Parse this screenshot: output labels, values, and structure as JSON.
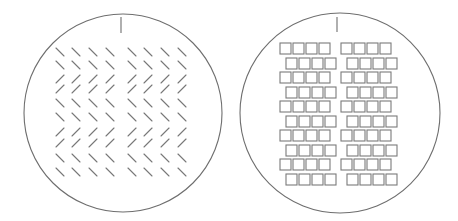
{
  "figure": {
    "width": 458,
    "height": 221,
    "colors": {
      "background": "#ffffff",
      "stroke": "#6e6e6e"
    },
    "panels": [
      {
        "id": "left",
        "label": "oriented-line-grid",
        "circle": {
          "cx": 123,
          "cy": 113,
          "r": 99
        },
        "tick": {
          "x": 121,
          "y1": 17,
          "y2": 33
        },
        "grid": {
          "columns_x": [
            60,
            76,
            93,
            110,
            132,
            148,
            165,
            182
          ],
          "rows_y": [
            52,
            65,
            79,
            89,
            103,
            117,
            132,
            143,
            158,
            172
          ],
          "row_orientations": [
            "\\",
            "\\",
            "/",
            "/",
            "\\",
            "\\",
            "/",
            "/",
            "\\",
            "\\"
          ],
          "segment_half_len": 4
        }
      },
      {
        "id": "right",
        "label": "staggered-square-grid",
        "circle": {
          "cx": 340,
          "cy": 113,
          "r": 100
        },
        "tick": {
          "x": 337,
          "y1": 17,
          "y2": 32
        },
        "grid": {
          "square_size": 11,
          "square_pitch": 13,
          "squares_per_group": 4,
          "odd_row_group_x": [
            280,
            341
          ],
          "even_row_group_x": [
            286,
            347
          ],
          "rows_y": [
            43,
            58,
            72,
            87,
            101,
            116,
            130,
            145,
            159,
            174
          ]
        }
      }
    ]
  }
}
